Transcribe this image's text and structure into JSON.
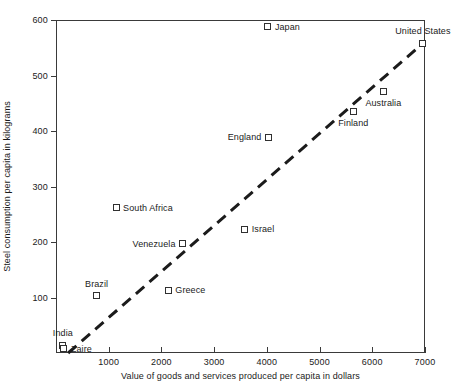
{
  "chart_data": {
    "type": "scatter",
    "title": "",
    "xlabel": "Value of goods and services produced per capita in dollars",
    "ylabel": "Steel consumption per capita in kilograms",
    "xlim": [
      0,
      7000
    ],
    "ylim": [
      0,
      600
    ],
    "xticks": [
      1000,
      2000,
      3000,
      4000,
      5000,
      6000,
      7000
    ],
    "xtick_labels": [
      "1000",
      "2000",
      "3000",
      "4000",
      "5000",
      "6000",
      "7000"
    ],
    "yticks": [
      100,
      200,
      300,
      400,
      500,
      600
    ],
    "ytick_labels": [
      "100",
      "200",
      "300",
      "400",
      "500",
      "600"
    ],
    "grid": false,
    "legend": "none",
    "marker_style": "open-square",
    "points": [
      {
        "label": "Japan",
        "x": 4020,
        "y": 588,
        "label_pos": "right"
      },
      {
        "label": "United States",
        "x": 6960,
        "y": 558,
        "label_pos": "above"
      },
      {
        "label": "Australia",
        "x": 6210,
        "y": 472,
        "label_pos": "below"
      },
      {
        "label": "Finland",
        "x": 5640,
        "y": 436,
        "label_pos": "below"
      },
      {
        "label": "England",
        "x": 4030,
        "y": 389,
        "label_pos": "left"
      },
      {
        "label": "South Africa",
        "x": 1140,
        "y": 262,
        "label_pos": "right"
      },
      {
        "label": "Israel",
        "x": 3580,
        "y": 223,
        "label_pos": "right"
      },
      {
        "label": "Venezuela",
        "x": 2400,
        "y": 197,
        "label_pos": "left"
      },
      {
        "label": "Greece",
        "x": 2130,
        "y": 113,
        "label_pos": "right"
      },
      {
        "label": "Brazil",
        "x": 770,
        "y": 103,
        "label_pos": "above"
      },
      {
        "label": "India",
        "x": 130,
        "y": 14,
        "label_pos": "above"
      },
      {
        "label": "Zaire",
        "x": 150,
        "y": 8,
        "label_pos": "right"
      }
    ],
    "trendline": {
      "style": "dashed",
      "color": "#1b1b1b",
      "x_start": 230,
      "y_start": 0,
      "x_end": 6960,
      "y_end": 558
    }
  }
}
